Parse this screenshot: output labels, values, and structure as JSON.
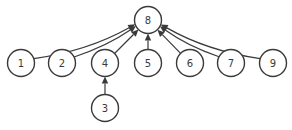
{
  "diagram": {
    "type": "tree",
    "colors": {
      "stroke": "#3a3a3a",
      "fill": "#ffffff"
    },
    "nodes": [
      {
        "id": "8",
        "label": "8"
      },
      {
        "id": "1",
        "label": "1"
      },
      {
        "id": "2",
        "label": "2"
      },
      {
        "id": "4",
        "label": "4"
      },
      {
        "id": "5",
        "label": "5"
      },
      {
        "id": "6",
        "label": "6"
      },
      {
        "id": "7",
        "label": "7"
      },
      {
        "id": "9",
        "label": "9"
      },
      {
        "id": "3",
        "label": "3"
      }
    ],
    "edges": [
      {
        "from": "1",
        "to": "8"
      },
      {
        "from": "2",
        "to": "8"
      },
      {
        "from": "4",
        "to": "8"
      },
      {
        "from": "5",
        "to": "8"
      },
      {
        "from": "6",
        "to": "8"
      },
      {
        "from": "7",
        "to": "8"
      },
      {
        "from": "9",
        "to": "8"
      },
      {
        "from": "3",
        "to": "4"
      }
    ]
  }
}
